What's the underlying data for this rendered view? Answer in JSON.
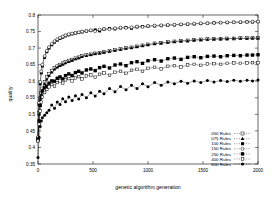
{
  "chart_data": {
    "type": "scatter",
    "title": "",
    "xlabel": "genetic algorithm generation",
    "ylabel": "quality",
    "xlim": [
      0,
      2000
    ],
    "ylim": [
      0.35,
      0.8
    ],
    "xticks": [
      0,
      500,
      1000,
      1500,
      2000
    ],
    "xtick_labels": [
      "0",
      "500",
      "1000",
      "1500",
      "2000"
    ],
    "yticks": [
      0.35,
      0.4,
      0.45,
      0.5,
      0.55,
      0.6,
      0.65,
      0.7,
      0.75,
      0.8
    ],
    "ytick_labels": [
      "0.35",
      "0.4",
      "0.45",
      "0.5",
      "0.55",
      "0.6",
      "0.65",
      "0.7",
      "0.75",
      "0.8"
    ],
    "grid": false,
    "legend_position": "lower right",
    "series": [
      {
        "name": "050 Rules",
        "marker": "open-square",
        "x": [
          0,
          10,
          20,
          30,
          40,
          60,
          80,
          100,
          125,
          150,
          175,
          200,
          225,
          250,
          280,
          310,
          340,
          370,
          400,
          440,
          480,
          520,
          560,
          600,
          650,
          700,
          750,
          800,
          850,
          900,
          950,
          1000,
          1060,
          1120,
          1180,
          1240,
          1300,
          1360,
          1420,
          1480,
          1540,
          1600,
          1660,
          1720,
          1780,
          1840,
          1900,
          1950,
          2000
        ],
        "y": [
          0.427,
          0.505,
          0.548,
          0.565,
          0.578,
          0.597,
          0.612,
          0.622,
          0.632,
          0.64,
          0.645,
          0.65,
          0.654,
          0.658,
          0.662,
          0.665,
          0.669,
          0.672,
          0.676,
          0.679,
          0.681,
          0.684,
          0.686,
          0.688,
          0.691,
          0.694,
          0.697,
          0.7,
          0.702,
          0.705,
          0.708,
          0.711,
          0.714,
          0.716,
          0.718,
          0.72,
          0.722,
          0.723,
          0.725,
          0.726,
          0.727,
          0.728,
          0.728,
          0.729,
          0.729,
          0.73,
          0.73,
          0.73,
          0.73
        ]
      },
      {
        "name": "075 Rules",
        "marker": "filled-triangle",
        "x": [
          0,
          10,
          20,
          30,
          40,
          60,
          80,
          100,
          125,
          150,
          175,
          200,
          225,
          250,
          280,
          310,
          340,
          370,
          400,
          440,
          480,
          520,
          560,
          600,
          650,
          700,
          750,
          800,
          850,
          900,
          950,
          1000,
          1060,
          1120,
          1180,
          1240,
          1300,
          1360,
          1420,
          1480,
          1540,
          1600,
          1660,
          1720,
          1780,
          1840,
          1900,
          1950,
          2000
        ],
        "y": [
          0.425,
          0.5,
          0.543,
          0.56,
          0.573,
          0.592,
          0.606,
          0.617,
          0.627,
          0.636,
          0.642,
          0.647,
          0.651,
          0.655,
          0.659,
          0.663,
          0.667,
          0.67,
          0.674,
          0.677,
          0.68,
          0.683,
          0.685,
          0.687,
          0.69,
          0.693,
          0.696,
          0.699,
          0.701,
          0.704,
          0.707,
          0.71,
          0.713,
          0.715,
          0.717,
          0.719,
          0.721,
          0.722,
          0.724,
          0.725,
          0.726,
          0.727,
          0.728,
          0.728,
          0.729,
          0.729,
          0.729,
          0.73,
          0.73
        ]
      },
      {
        "name": "100 Rules",
        "marker": "filled-square",
        "x": [
          0,
          10,
          20,
          30,
          40,
          60,
          80,
          100,
          125,
          150,
          175,
          200,
          225,
          250,
          280,
          310,
          340,
          370,
          400,
          440,
          480,
          520,
          560,
          600,
          650,
          700,
          750,
          800,
          850,
          900,
          950,
          1000,
          1060,
          1120,
          1180,
          1240,
          1300,
          1360,
          1420,
          1480,
          1540,
          1600,
          1660,
          1720,
          1780,
          1840,
          1900,
          1950,
          2000
        ],
        "y": [
          0.43,
          0.53,
          0.592,
          0.625,
          0.646,
          0.672,
          0.689,
          0.7,
          0.71,
          0.718,
          0.724,
          0.729,
          0.733,
          0.737,
          0.74,
          0.743,
          0.745,
          0.747,
          0.749,
          0.751,
          0.753,
          0.755,
          0.752,
          0.757,
          0.759,
          0.758,
          0.761,
          0.762,
          0.76,
          0.764,
          0.765,
          0.766,
          0.767,
          0.768,
          0.769,
          0.77,
          0.771,
          0.772,
          0.773,
          0.774,
          0.775,
          0.776,
          0.777,
          0.777,
          0.778,
          0.778,
          0.779,
          0.779,
          0.78
        ]
      },
      {
        "name": "150 Rules",
        "marker": "open-circle",
        "x": [
          0,
          10,
          20,
          30,
          40,
          60,
          80,
          100,
          125,
          150,
          175,
          200,
          225,
          250,
          280,
          310,
          340,
          370,
          400,
          440,
          480,
          520,
          560,
          600,
          650,
          700,
          750,
          800,
          850,
          900,
          950,
          1000,
          1060,
          1120,
          1180,
          1240,
          1300,
          1360,
          1420,
          1480,
          1540,
          1600,
          1660,
          1720,
          1780,
          1840,
          1900,
          1950,
          2000
        ],
        "y": [
          0.432,
          0.535,
          0.598,
          0.63,
          0.65,
          0.676,
          0.692,
          0.703,
          0.713,
          0.721,
          0.727,
          0.731,
          0.735,
          0.739,
          0.742,
          0.744,
          0.746,
          0.748,
          0.75,
          0.752,
          0.754,
          0.751,
          0.756,
          0.758,
          0.757,
          0.76,
          0.762,
          0.761,
          0.763,
          0.765,
          0.764,
          0.767,
          0.768,
          0.769,
          0.77,
          0.771,
          0.772,
          0.773,
          0.774,
          0.775,
          0.775,
          0.776,
          0.777,
          0.778,
          0.778,
          0.779,
          0.779,
          0.78,
          0.78
        ]
      },
      {
        "name": "250 Rules",
        "marker": "filled-square-lg",
        "x": [
          0,
          10,
          20,
          30,
          40,
          60,
          80,
          100,
          125,
          150,
          175,
          200,
          225,
          250,
          280,
          310,
          340,
          370,
          400,
          440,
          480,
          520,
          560,
          600,
          650,
          700,
          750,
          800,
          850,
          900,
          950,
          1000,
          1060,
          1120,
          1180,
          1240,
          1300,
          1360,
          1420,
          1480,
          1540,
          1600,
          1660,
          1720,
          1780,
          1840,
          1900,
          1950,
          2000
        ],
        "y": [
          0.423,
          0.48,
          0.527,
          0.552,
          0.57,
          0.58,
          0.585,
          0.594,
          0.601,
          0.6,
          0.609,
          0.613,
          0.607,
          0.617,
          0.622,
          0.617,
          0.626,
          0.63,
          0.625,
          0.634,
          0.637,
          0.632,
          0.641,
          0.645,
          0.64,
          0.649,
          0.652,
          0.647,
          0.656,
          0.659,
          0.654,
          0.662,
          0.665,
          0.661,
          0.668,
          0.67,
          0.666,
          0.672,
          0.674,
          0.671,
          0.675,
          0.676,
          0.674,
          0.677,
          0.678,
          0.677,
          0.679,
          0.679,
          0.68
        ]
      },
      {
        "name": "400 Rules",
        "marker": "open-square-sm",
        "x": [
          0,
          10,
          20,
          30,
          40,
          60,
          80,
          100,
          125,
          150,
          175,
          200,
          225,
          250,
          280,
          310,
          340,
          370,
          400,
          440,
          480,
          520,
          560,
          600,
          650,
          700,
          750,
          800,
          850,
          900,
          950,
          1000,
          1060,
          1120,
          1180,
          1240,
          1300,
          1360,
          1420,
          1480,
          1540,
          1600,
          1660,
          1720,
          1780,
          1840,
          1900,
          1950,
          2000
        ],
        "y": [
          0.42,
          0.47,
          0.51,
          0.537,
          0.552,
          0.566,
          0.575,
          0.583,
          0.59,
          0.585,
          0.596,
          0.601,
          0.594,
          0.604,
          0.608,
          0.601,
          0.61,
          0.614,
          0.607,
          0.616,
          0.619,
          0.612,
          0.621,
          0.625,
          0.618,
          0.627,
          0.63,
          0.624,
          0.633,
          0.636,
          0.63,
          0.639,
          0.642,
          0.637,
          0.645,
          0.647,
          0.643,
          0.649,
          0.651,
          0.648,
          0.652,
          0.653,
          0.651,
          0.654,
          0.655,
          0.654,
          0.655,
          0.656,
          0.656
        ]
      },
      {
        "name": "600 Rules",
        "marker": "filled-circle",
        "x": [
          0,
          10,
          20,
          30,
          40,
          60,
          80,
          100,
          125,
          150,
          175,
          200,
          225,
          250,
          280,
          310,
          340,
          370,
          400,
          440,
          480,
          520,
          560,
          600,
          650,
          700,
          750,
          800,
          850,
          900,
          950,
          1000,
          1060,
          1120,
          1180,
          1240,
          1300,
          1360,
          1420,
          1480,
          1540,
          1600,
          1660,
          1720,
          1780,
          1840,
          1900,
          1950,
          2000
        ],
        "y": [
          0.37,
          0.43,
          0.463,
          0.48,
          0.49,
          0.497,
          0.505,
          0.512,
          0.528,
          0.518,
          0.537,
          0.53,
          0.547,
          0.538,
          0.552,
          0.542,
          0.556,
          0.546,
          0.56,
          0.55,
          0.565,
          0.555,
          0.57,
          0.562,
          0.578,
          0.568,
          0.584,
          0.574,
          0.588,
          0.578,
          0.592,
          0.583,
          0.596,
          0.588,
          0.598,
          0.592,
          0.6,
          0.594,
          0.601,
          0.596,
          0.602,
          0.598,
          0.602,
          0.599,
          0.603,
          0.6,
          0.603,
          0.601,
          0.604
        ]
      }
    ]
  }
}
